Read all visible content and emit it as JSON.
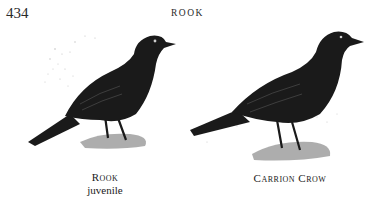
{
  "page": {
    "number": "434",
    "running_head": "ROOK"
  },
  "figures": [
    {
      "subject": "rook-juvenile-illustration",
      "caption_line1": "Rook",
      "caption_line2": "juvenile"
    },
    {
      "subject": "carrion-crow-illustration",
      "caption_line1": "Carrion Crow"
    }
  ],
  "colors": {
    "ink": "#1a1a1a",
    "paper": "#ffffff",
    "stipple": "#9a9a9a"
  }
}
